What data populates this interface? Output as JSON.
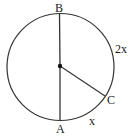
{
  "diagram": {
    "type": "circle-geometry",
    "circle": {
      "cx": 60.5,
      "cy": 67,
      "r": 53.5,
      "stroke": "#333333"
    },
    "center": {
      "x": 60,
      "y": 66
    },
    "points": {
      "B": {
        "label": "B",
        "x": 59.5,
        "y": 13.5
      },
      "A": {
        "label": "A",
        "x": 60,
        "y": 120.5
      },
      "C": {
        "label": "C",
        "x": 105,
        "y": 96
      }
    },
    "segments": [
      {
        "from": "center",
        "to": "B"
      },
      {
        "from": "center",
        "to": "A"
      },
      {
        "from": "center",
        "to": "C"
      }
    ],
    "arc_labels": {
      "BC": "2x",
      "AC": "x"
    }
  }
}
